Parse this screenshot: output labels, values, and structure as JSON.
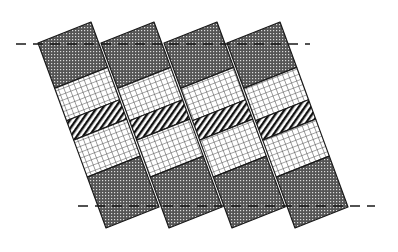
{
  "figure": {
    "width": 398,
    "height": 252,
    "background": "#ffffff",
    "stroke_color": "#1a1a1a"
  },
  "geometry": {
    "column_count": 4,
    "column_spacing_x": 63,
    "first_top_left": [
      38,
      43
    ],
    "top_edge_vector": [
      53,
      -21
    ],
    "side_edge_vector": [
      68,
      185
    ],
    "bands": [
      {
        "name": "top-dark",
        "pattern": "dots",
        "from": 0.0,
        "to": 0.245
      },
      {
        "name": "upper-grid",
        "pattern": "grid",
        "from": 0.245,
        "to": 0.42
      },
      {
        "name": "middle-stripes",
        "pattern": "stripes",
        "from": 0.42,
        "to": 0.525
      },
      {
        "name": "lower-grid",
        "pattern": "grid",
        "from": 0.525,
        "to": 0.725
      },
      {
        "name": "bottom-dark",
        "pattern": "dots",
        "from": 0.725,
        "to": 1.0
      }
    ]
  },
  "reference_lines": [
    {
      "name": "top-dashed-line",
      "x1": 16,
      "x2": 310,
      "y": 44
    },
    {
      "name": "bottom-dashed-line",
      "x1": 78,
      "x2": 375,
      "y": 206
    }
  ],
  "patterns": {
    "dots": {
      "fill": "#5a5a5a",
      "dot": "#d8d8d8"
    },
    "grid": {
      "fill": "#ffffff",
      "line": "#444444"
    },
    "stripes": {
      "fill": "#ffffff",
      "line": "#111111"
    }
  }
}
